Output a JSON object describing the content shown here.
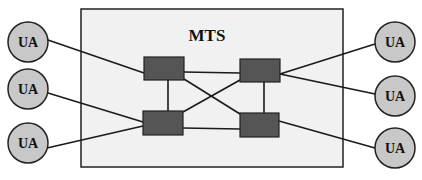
{
  "diagram": {
    "title": "MTS",
    "colors": {
      "background": "#ffffff",
      "mts_fill": "#f1f1f1",
      "border": "#222222",
      "node_fill": "#555555",
      "ua_fill": "#c8c8c8",
      "line": "#1a1a1a"
    },
    "mts_box": {
      "x": 81,
      "y": 9,
      "w": 262,
      "h": 158
    },
    "nodes": [
      {
        "id": "mta-top-left",
        "x": 144,
        "y": 57,
        "w": 40,
        "h": 23
      },
      {
        "id": "mta-top-right",
        "x": 240,
        "y": 59,
        "w": 40,
        "h": 23
      },
      {
        "id": "mta-bottom-left",
        "x": 143,
        "y": 111,
        "w": 40,
        "h": 24
      },
      {
        "id": "mta-bottom-right",
        "x": 240,
        "y": 113,
        "w": 39,
        "h": 24
      }
    ],
    "user_agents": [
      {
        "id": "ua-left-1",
        "label": "UA",
        "cx": 28,
        "cy": 42,
        "r": 20
      },
      {
        "id": "ua-left-2",
        "label": "UA",
        "cx": 28,
        "cy": 89,
        "r": 20
      },
      {
        "id": "ua-left-3",
        "label": "UA",
        "cx": 28,
        "cy": 143,
        "r": 20
      },
      {
        "id": "ua-right-1",
        "label": "UA",
        "cx": 395,
        "cy": 42,
        "r": 20
      },
      {
        "id": "ua-right-2",
        "label": "UA",
        "cx": 395,
        "cy": 96,
        "r": 20
      },
      {
        "id": "ua-right-3",
        "label": "UA",
        "cx": 395,
        "cy": 148,
        "r": 20
      }
    ],
    "links": [
      {
        "from": "ua-left-1",
        "to": "mta-top-left",
        "x1": 48,
        "y1": 40,
        "x2": 144,
        "y2": 73
      },
      {
        "from": "ua-left-2",
        "to": "mta-bottom-left",
        "x1": 48,
        "y1": 93,
        "x2": 143,
        "y2": 122
      },
      {
        "from": "ua-left-3",
        "to": "mta-bottom-left",
        "x1": 47,
        "y1": 148,
        "x2": 143,
        "y2": 126
      },
      {
        "from": "mta-top-right",
        "to": "ua-right-1",
        "x1": 280,
        "y1": 74,
        "x2": 375,
        "y2": 44
      },
      {
        "from": "mta-top-right",
        "to": "ua-right-2",
        "x1": 280,
        "y1": 74,
        "x2": 375,
        "y2": 94
      },
      {
        "from": "mta-bottom-right",
        "to": "ua-right-3",
        "x1": 279,
        "y1": 121,
        "x2": 375,
        "y2": 148
      },
      {
        "from": "mta-top-left",
        "to": "mta-top-right",
        "x1": 184,
        "y1": 72,
        "x2": 240,
        "y2": 73
      },
      {
        "from": "mta-bottom-left",
        "to": "mta-bottom-right",
        "x1": 183,
        "y1": 128,
        "x2": 240,
        "y2": 129
      },
      {
        "from": "mta-top-left",
        "to": "mta-bottom-left",
        "x1": 168,
        "y1": 80,
        "x2": 168,
        "y2": 111
      },
      {
        "from": "mta-top-right",
        "to": "mta-bottom-right",
        "x1": 264,
        "y1": 82,
        "x2": 264,
        "y2": 113
      },
      {
        "from": "mta-top-left",
        "to": "mta-bottom-right",
        "x1": 184,
        "y1": 79,
        "x2": 240,
        "y2": 114
      },
      {
        "from": "mta-bottom-left",
        "to": "mta-top-right",
        "x1": 183,
        "y1": 112,
        "x2": 240,
        "y2": 80
      }
    ]
  }
}
